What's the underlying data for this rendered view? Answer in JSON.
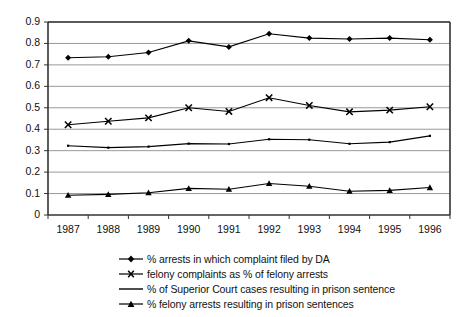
{
  "chart_data": {
    "type": "line",
    "title": "",
    "xlabel": "",
    "ylabel": "",
    "categories": [
      "1987",
      "1988",
      "1989",
      "1990",
      "1991",
      "1992",
      "1993",
      "1994",
      "1995",
      "1996"
    ],
    "yticks": [
      "0",
      "0.1",
      "0.2",
      "0.3",
      "0.4",
      "0.5",
      "0.6",
      "0.7",
      "0.8",
      "0.9"
    ],
    "ylim": [
      0,
      0.9
    ],
    "grid": "horizontal",
    "legend_position": "bottom",
    "series": [
      {
        "name": "% arrests in which complaint filed by DA",
        "marker": "diamond",
        "color": "#000000",
        "values": [
          0.733,
          0.738,
          0.758,
          0.812,
          0.784,
          0.845,
          0.825,
          0.821,
          0.825,
          0.817
        ]
      },
      {
        "name": "felony complaints as % of felony arrests",
        "marker": "x",
        "color": "#000000",
        "values": [
          0.421,
          0.437,
          0.453,
          0.5,
          0.483,
          0.547,
          0.511,
          0.481,
          0.489,
          0.505
        ]
      },
      {
        "name": "% of Superior Court cases resulting in prison sentence",
        "marker": "none",
        "color": "#000000",
        "values": [
          0.323,
          0.314,
          0.319,
          0.333,
          0.331,
          0.353,
          0.351,
          0.332,
          0.34,
          0.369
        ]
      },
      {
        "name": "% felony arrests resulting in prison sentences",
        "marker": "triangle",
        "color": "#000000",
        "values": [
          0.092,
          0.096,
          0.104,
          0.124,
          0.12,
          0.147,
          0.134,
          0.111,
          0.115,
          0.128
        ]
      }
    ]
  },
  "axes": {
    "gridline_color": "#999999",
    "axis_color": "#333333"
  }
}
